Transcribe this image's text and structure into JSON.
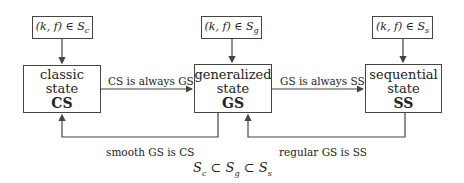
{
  "top_boxes": [
    {
      "pre": "(k, f) ∈ S",
      "sub": "c"
    },
    {
      "pre": "(k, f) ∈ S",
      "sub": "g"
    },
    {
      "pre": "(k, f) ∈ S",
      "sub": "s"
    }
  ],
  "states": [
    {
      "line1": "classic",
      "line2": "state",
      "abbr": "CS"
    },
    {
      "line1": "generalized",
      "line2": "state",
      "abbr": "GS"
    },
    {
      "line1": "sequential",
      "line2": "state",
      "abbr": "SS"
    }
  ],
  "edges": {
    "cs_to_gs": "CS is always GS",
    "gs_to_ss": "GS is always SS",
    "gs_to_cs": "smooth GS is CS",
    "ss_to_gs": "regular GS is SS"
  },
  "formula": {
    "s1": "S",
    "sub1": "c",
    "op1": " ⊂ ",
    "s2": "S",
    "sub2": "g",
    "op2": " ⊂ ",
    "s3": "S",
    "sub3": "s"
  },
  "colors": {
    "line": "#444444",
    "text": "#222222"
  }
}
